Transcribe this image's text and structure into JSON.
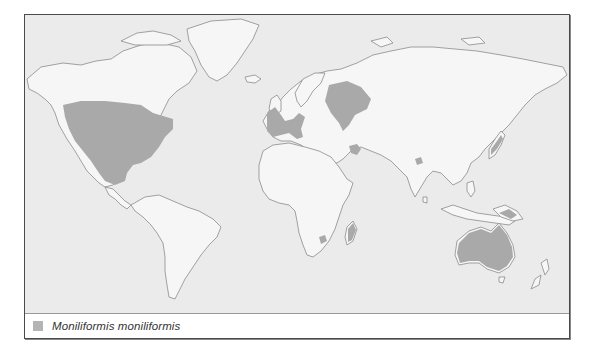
{
  "map": {
    "title": "",
    "type": "world distribution map",
    "colors": {
      "ocean": "#ebebeb",
      "land": "#f6f6f6",
      "coastline": "#8c8c8c",
      "distribution": "#a9a9a9"
    },
    "distribution_regions": [
      "North America (USA, southern Canada, Mexico)",
      "Western Europe (Iberia, France, Italy, British Isles)",
      "Eastern Europe / Western Russia",
      "Middle East (Iraq/Iran)",
      "Northeast India",
      "Japan",
      "Papua New Guinea",
      "Australia",
      "South Africa",
      "Madagascar"
    ]
  },
  "legend": {
    "items": [
      {
        "label": "Moniliformis moniliformis",
        "color": "#b4b4b4"
      }
    ]
  }
}
